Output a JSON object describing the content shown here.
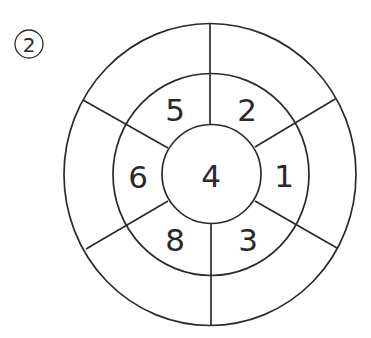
{
  "problem": {
    "number_label": "2"
  },
  "diagram": {
    "type": "ring-puzzle",
    "center": {
      "value": "4"
    },
    "middle_ring": [
      {
        "position": "top-left",
        "value": "5"
      },
      {
        "position": "top-right",
        "value": "2"
      },
      {
        "position": "right",
        "value": "1"
      },
      {
        "position": "bottom-right",
        "value": "3"
      },
      {
        "position": "bottom-left",
        "value": "8"
      },
      {
        "position": "left",
        "value": "6"
      }
    ],
    "outer_ring": [
      {
        "position": "top-left",
        "value": ""
      },
      {
        "position": "top-right",
        "value": ""
      },
      {
        "position": "right",
        "value": ""
      },
      {
        "position": "bottom-right",
        "value": ""
      },
      {
        "position": "bottom-left",
        "value": ""
      },
      {
        "position": "left",
        "value": ""
      }
    ],
    "line_color": "#2a2a2a"
  }
}
